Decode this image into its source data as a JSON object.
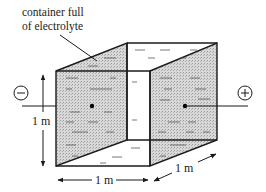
{
  "diagram": {
    "label": {
      "line1": "container full",
      "line2": "of electrolyte"
    },
    "dimensions": {
      "height_label": "1 m",
      "width_label": "1 m",
      "depth_label": "1 m"
    },
    "terminals": {
      "negative_symbol": "−",
      "positive_symbol": "+"
    },
    "colors": {
      "stroke": "#1a1a1a",
      "hatch_fill": "#d4d4d4",
      "background": "#ffffff"
    }
  }
}
